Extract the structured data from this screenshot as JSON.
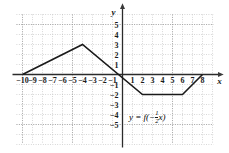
{
  "figure": {
    "axis_x_label": "x",
    "axis_y_label": "y",
    "equation_parts": {
      "lead": "y = f(−",
      "numerator": "1",
      "denominator": "2",
      "tail": "x)"
    },
    "equation_text": "y = f(-1/2 x)"
  },
  "chart_data": {
    "type": "line",
    "title": "",
    "xlabel": "x",
    "ylabel": "y",
    "xlim": [
      -11,
      9
    ],
    "ylim": [
      -6,
      6
    ],
    "grid": true,
    "legend": null,
    "annotations": [
      {
        "text": "y = f(-1/2 x)",
        "x": -3.2,
        "y": -4.0
      }
    ],
    "xticks": [
      -10,
      -9,
      -8,
      -7,
      -6,
      -5,
      -4,
      -3,
      -2,
      -1,
      1,
      2,
      3,
      4,
      5,
      6,
      7,
      8
    ],
    "xtick_labels": [
      "−10",
      "−9",
      "−8",
      "−7",
      "−6",
      "−5",
      "−4",
      "−3",
      "−2",
      "−1",
      "1",
      "2",
      "3",
      "4",
      "5",
      "6",
      "7",
      "8"
    ],
    "yticks": [
      5,
      4,
      3,
      2,
      1,
      -1,
      -2,
      -3,
      -4,
      -5
    ],
    "ytick_labels": [
      "5",
      "4",
      "3",
      "2",
      "1",
      "−1",
      "−2",
      "−3",
      "−4",
      "−5"
    ],
    "series": [
      {
        "name": "y = f(-1/2 x)",
        "color": "#1a1a1a",
        "x": [
          -10,
          -4,
          2,
          6,
          8
        ],
        "y": [
          0,
          3,
          -2,
          -2,
          0
        ]
      }
    ]
  }
}
